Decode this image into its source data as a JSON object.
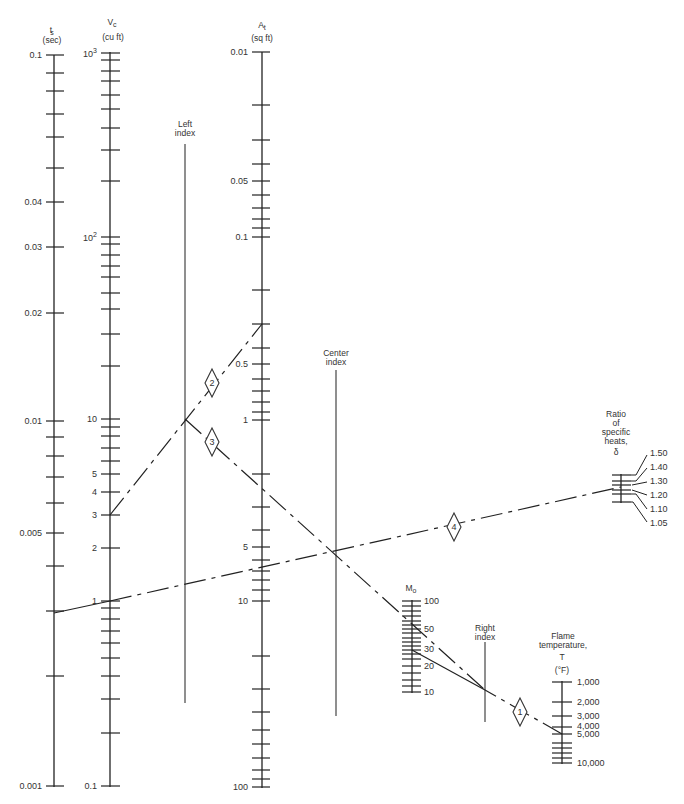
{
  "axes": {
    "ts": {
      "symbol": "t",
      "sub": "s",
      "unit": "(sec)",
      "labels": [
        "0.1",
        "0.04",
        "0.03",
        "0.02",
        "0.01",
        "0.005",
        "0.001"
      ]
    },
    "vc": {
      "symbol": "V",
      "sub": "c",
      "unit": "(cu ft)",
      "labels": [
        "10",
        "3",
        "10",
        "2",
        "10",
        "5",
        "4",
        "3",
        "2",
        "1",
        "0.1"
      ]
    },
    "at": {
      "symbol": "A",
      "sub": "t",
      "unit": "(sq ft)",
      "labels": [
        "0.01",
        "0.05",
        "0.1",
        "0.5",
        "1",
        "5",
        "10",
        "100"
      ]
    },
    "mo": {
      "symbol": "M",
      "sub": "o",
      "labels": [
        "100",
        "50",
        "30",
        "20",
        "10"
      ]
    },
    "flame": {
      "title1": "Flame",
      "title2": "temperature,",
      "symbol": "T",
      "unit": "(°F)",
      "labels": [
        "1,000",
        "2,000",
        "3,000",
        "4,000",
        "5,000",
        "10,000"
      ]
    },
    "gamma": {
      "title1": "Ratio",
      "title2": "of",
      "title3": "specific",
      "title4": "heats,",
      "symbol": "δ",
      "labels": [
        "1.50",
        "1.40",
        "1.30",
        "1.20",
        "1.10",
        "1.05"
      ]
    }
  },
  "indexes": {
    "left": {
      "line1": "Left",
      "line2": "index"
    },
    "center": {
      "line1": "Center",
      "line2": "index"
    },
    "right": {
      "line1": "Right",
      "line2": "index"
    }
  },
  "keys": [
    "1",
    "2",
    "3",
    "4"
  ]
}
